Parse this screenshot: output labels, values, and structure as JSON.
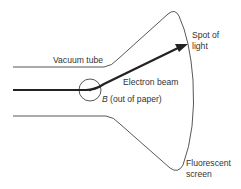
{
  "diagram": {
    "labels": {
      "vacuum_tube": "Vacuum tube",
      "spot_line1": "Spot of",
      "spot_line2": "light",
      "electron_beam": "Electron beam",
      "b_symbol": "B",
      "b_desc": " (out of paper)",
      "screen_line1": "Fluorescent",
      "screen_line2": "screen"
    },
    "colors": {
      "outline": "#444444",
      "beam": "#222222",
      "text": "#333333"
    }
  }
}
